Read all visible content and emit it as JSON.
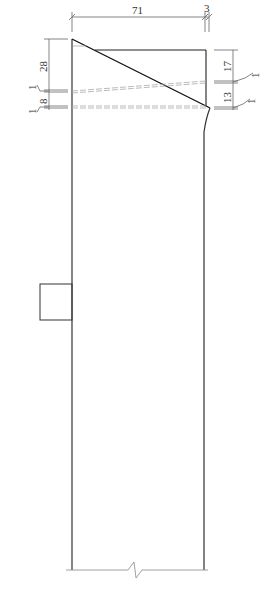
{
  "drawing": {
    "type": "technical cross-section sketch",
    "colors": {
      "outline": "#222222",
      "dimension": "#555555",
      "dashed": "#aaaaaa",
      "background": "#ffffff"
    },
    "dimensions": {
      "top_width": "71",
      "top_right_offset": "3",
      "left_height": "28",
      "left_small_top": "1",
      "left_lower": "8",
      "left_small_bottom": "1",
      "right_upper": "17",
      "right_small_top": "1",
      "right_lower": "13",
      "right_small_bottom": "1"
    }
  }
}
